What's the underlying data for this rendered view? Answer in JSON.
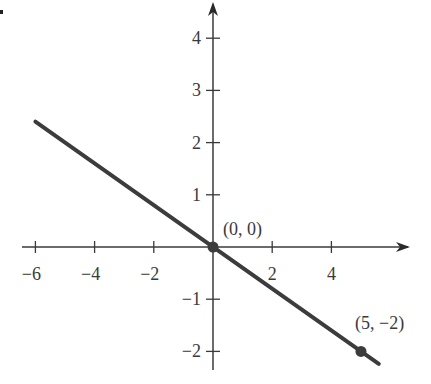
{
  "chart_data": {
    "type": "line",
    "title": "",
    "xlabel": "",
    "ylabel": "",
    "xlim": [
      -6.3,
      6.6
    ],
    "ylim": [
      -2.4,
      4.6
    ],
    "grid": false,
    "x_ticks": [
      -6,
      -4,
      -2,
      2,
      4
    ],
    "x_tick_labels": [
      "−6",
      "−4",
      "−2",
      "2",
      "4"
    ],
    "y_ticks": [
      4,
      3,
      2,
      1,
      -1,
      -2
    ],
    "y_tick_labels": [
      "4",
      "3",
      "2",
      "1",
      "−1",
      "−2"
    ],
    "series": [
      {
        "name": "y = -2/5 x",
        "x": [
          -6,
          5.6
        ],
        "y": [
          2.4,
          -2.24
        ],
        "slope": -0.4,
        "intercept": 0
      }
    ],
    "points": [
      {
        "x": 0,
        "y": 0,
        "label": "(0, 0)"
      },
      {
        "x": 5,
        "y": -2,
        "label": "(5, −2)"
      }
    ],
    "colors": {
      "line": "#3c3c3c",
      "axis": "#3a3a3a",
      "point": "#3c3c3c"
    }
  }
}
